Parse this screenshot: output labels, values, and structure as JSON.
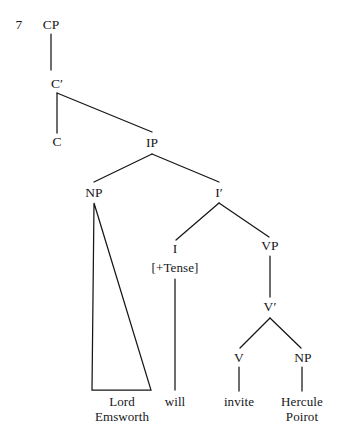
{
  "figure": {
    "example_number": "7",
    "type": "syntax-tree",
    "ink_color": "#16161a",
    "background_color": "#ffffff"
  },
  "nodes": {
    "cp": "CP",
    "cbar": "C′",
    "c": "C",
    "ip": "IP",
    "np_subject": "NP",
    "ibar": "I′",
    "i": "I",
    "i_features": "[+Tense]",
    "vp": "VP",
    "vbar": "V′",
    "v": "V",
    "np_object": "NP"
  },
  "leaves": {
    "subject_line1": "Lord",
    "subject_line2": "Emsworth",
    "aux": "will",
    "verb": "invite",
    "object_line1": "Hercule",
    "object_line2": "Poirot"
  }
}
